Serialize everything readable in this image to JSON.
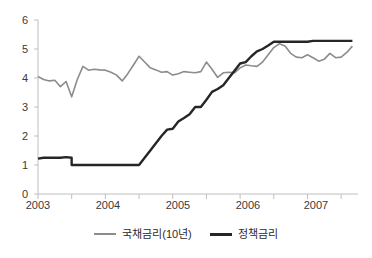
{
  "chart_data": {
    "type": "line",
    "title": "",
    "subtitle": "",
    "xlabel": "",
    "ylabel": "",
    "ylim": [
      0,
      6
    ],
    "yticks": [
      0,
      1,
      2,
      3,
      4,
      5,
      6
    ],
    "ytick_labels": [
      "0",
      "1",
      "2",
      "3",
      "4",
      "5",
      "6"
    ],
    "xlim": [
      2003.0,
      2007.75
    ],
    "xticks": [
      2003,
      2004,
      2005,
      2006,
      2007
    ],
    "xtick_labels": [
      "2003",
      "2004",
      "2005",
      "2006",
      "2007"
    ],
    "minor_xticks": [
      2003.5,
      2004.5,
      2005.5,
      2006.5,
      2007.5
    ],
    "grid": false,
    "legend_position": "bottom",
    "colors": {
      "government_bond": "#8c8c8c",
      "policy_rate": "#262626",
      "axis": "#bfbfbf",
      "tick_text": "#3a3a3a",
      "background": "#ffffff"
    },
    "series": [
      {
        "name": "국채금리(10년)",
        "color": "#8c8c8c",
        "width": 1.6,
        "x": [
          2003.0,
          2003.083,
          2003.167,
          2003.25,
          2003.333,
          2003.417,
          2003.5,
          2003.583,
          2003.667,
          2003.75,
          2003.833,
          2003.917,
          2004.0,
          2004.083,
          2004.167,
          2004.25,
          2004.333,
          2004.417,
          2004.5,
          2004.583,
          2004.667,
          2004.75,
          2004.833,
          2004.917,
          2005.0,
          2005.083,
          2005.167,
          2005.25,
          2005.333,
          2005.417,
          2005.5,
          2005.583,
          2005.667,
          2005.75,
          2005.833,
          2005.917,
          2006.0,
          2006.083,
          2006.167,
          2006.25,
          2006.333,
          2006.417,
          2006.5,
          2006.583,
          2006.667,
          2006.75,
          2006.833,
          2006.917,
          2007.0,
          2007.083,
          2007.167,
          2007.25,
          2007.333,
          2007.417,
          2007.5,
          2007.583,
          2007.667
        ],
        "values": [
          4.05,
          3.95,
          3.9,
          3.92,
          3.7,
          3.88,
          3.35,
          3.95,
          4.4,
          4.27,
          4.3,
          4.28,
          4.27,
          4.2,
          4.1,
          3.9,
          4.15,
          4.45,
          4.75,
          4.55,
          4.35,
          4.28,
          4.2,
          4.22,
          4.1,
          4.15,
          4.22,
          4.2,
          4.18,
          4.22,
          4.55,
          4.3,
          4.02,
          4.18,
          4.2,
          4.18,
          4.35,
          4.45,
          4.42,
          4.4,
          4.55,
          4.8,
          5.05,
          5.18,
          5.1,
          4.85,
          4.72,
          4.7,
          4.8,
          4.7,
          4.58,
          4.65,
          4.85,
          4.7,
          4.72,
          4.88,
          5.1
        ],
        "endpoint_value": 5.05
      },
      {
        "name": "정책금리",
        "color": "#262626",
        "width": 2.4,
        "x": [
          2003.0,
          2003.083,
          2003.167,
          2003.25,
          2003.333,
          2003.417,
          2003.499,
          2003.5,
          2003.583,
          2003.667,
          2003.75,
          2003.833,
          2003.917,
          2004.0,
          2004.083,
          2004.167,
          2004.25,
          2004.333,
          2004.417,
          2004.5,
          2004.583,
          2004.667,
          2004.75,
          2004.833,
          2004.917,
          2005.0,
          2005.083,
          2005.167,
          2005.25,
          2005.333,
          2005.417,
          2005.5,
          2005.583,
          2005.667,
          2005.75,
          2005.833,
          2005.917,
          2006.0,
          2006.083,
          2006.167,
          2006.25,
          2006.333,
          2006.417,
          2006.5,
          2006.583,
          2006.667,
          2006.75,
          2006.833,
          2006.917,
          2007.0,
          2007.083,
          2007.167,
          2007.25,
          2007.333,
          2007.417,
          2007.5,
          2007.583,
          2007.667
        ],
        "values": [
          1.22,
          1.25,
          1.25,
          1.25,
          1.25,
          1.27,
          1.25,
          1.0,
          1.0,
          1.0,
          1.0,
          1.0,
          1.0,
          1.0,
          1.0,
          1.0,
          1.0,
          1.0,
          1.0,
          1.0,
          1.25,
          1.5,
          1.75,
          2.0,
          2.22,
          2.25,
          2.5,
          2.62,
          2.75,
          3.0,
          3.0,
          3.25,
          3.52,
          3.62,
          3.75,
          4.0,
          4.25,
          4.5,
          4.55,
          4.75,
          4.92,
          5.0,
          5.12,
          5.25,
          5.25,
          5.25,
          5.25,
          5.25,
          5.25,
          5.25,
          5.28,
          5.28,
          5.28,
          5.28,
          5.28,
          5.28,
          5.28,
          5.28
        ],
        "endpoint_value": 5.28
      }
    ],
    "annotations": []
  },
  "legend": {
    "items": [
      {
        "label": "국채금리(10년)",
        "swatch": "gray"
      },
      {
        "label": "정책금리",
        "swatch": "black"
      }
    ]
  }
}
